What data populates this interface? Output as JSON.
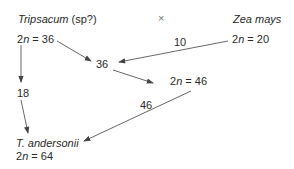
{
  "parent_left": {
    "name": "Tripsacum",
    "suffix": " (sp?)",
    "chromosomes": "2n = 36",
    "n_prefix": "2",
    "n_var": "n",
    "n_value": " = 36"
  },
  "cross_symbol": "×",
  "parent_right": {
    "name": "Zea mays",
    "n_prefix": "2",
    "n_var": "n",
    "n_value": " = 20"
  },
  "intermediate_36": "36",
  "hybrid_46": {
    "n_prefix": "2",
    "n_var": "n",
    "n_value": " = 46"
  },
  "edge_labels": {
    "zea_gamete": "10",
    "tripsacum_gamete": "18",
    "hybrid_gamete": "46"
  },
  "offspring": {
    "name": "T. andersonii",
    "n_prefix": "2",
    "n_var": "n",
    "n_value": " = 64"
  },
  "colors": {
    "line": "#555555",
    "text": "#2a2a2a"
  }
}
